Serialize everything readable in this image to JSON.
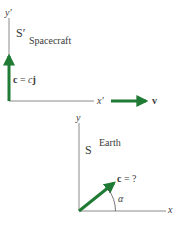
{
  "colors": {
    "axis": "#8a8a8a",
    "vector": "#1f7a33",
    "text": "#3a3a3a",
    "background": "#ffffff"
  },
  "spacecraft_frame": {
    "frame_label": "S′",
    "frame_name": "Spacecraft",
    "y_axis_label": "y′",
    "x_axis_label": "x′",
    "light_vector_bold": "c",
    "light_vector_eq": " = ",
    "light_vector_scalar": "c",
    "light_vector_unit": "j",
    "velocity_label": "v"
  },
  "earth_frame": {
    "frame_label": "S",
    "frame_name": "Earth",
    "y_axis_label": "y",
    "x_axis_label": "x",
    "light_vector_bold": "c",
    "light_vector_eq": " = ?",
    "angle_label": "α"
  }
}
